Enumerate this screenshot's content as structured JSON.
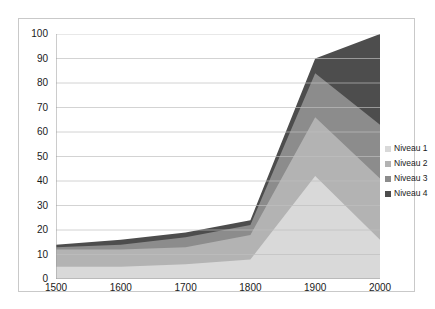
{
  "chart_data": {
    "type": "area",
    "title": "",
    "xlabel": "",
    "ylabel": "",
    "stacked": true,
    "grid": true,
    "legend_position": "right",
    "x": [
      1500,
      1600,
      1700,
      1800,
      1900,
      2000
    ],
    "xlim": [
      1500,
      2000
    ],
    "ylim": [
      0,
      100
    ],
    "ytick_labels": [
      "0",
      "10",
      "20",
      "30",
      "40",
      "50",
      "60",
      "70",
      "80",
      "90",
      "100"
    ],
    "yticks": [
      0,
      10,
      20,
      30,
      40,
      50,
      60,
      70,
      80,
      90,
      100
    ],
    "xtick_labels": [
      "1500",
      "1600",
      "1700",
      "1800",
      "1900",
      "2000"
    ],
    "xticks": [
      1500,
      1600,
      1700,
      1800,
      1900,
      2000
    ],
    "series": [
      {
        "name": "Niveau 1",
        "color": "#d9d9d9",
        "values": [
          5,
          5,
          6,
          8,
          42,
          16
        ]
      },
      {
        "name": "Niveau 2",
        "color": "#b3b3b3",
        "values": [
          7,
          7,
          7,
          10,
          24,
          25
        ]
      },
      {
        "name": "Niveau 3",
        "color": "#8c8c8c",
        "values": [
          1,
          2,
          4,
          4,
          18,
          22
        ]
      },
      {
        "name": "Niveau 4",
        "color": "#4d4d4d",
        "values": [
          1,
          2,
          2,
          2,
          6,
          37
        ]
      }
    ],
    "cumulative_totals": [
      14,
      16,
      19,
      24,
      90,
      100
    ],
    "colors": {
      "grid": "#bfbfbf",
      "axis": "#9a9a9a",
      "frame": "#c9c9c9",
      "text": "#1a1a1a",
      "background": "#ffffff"
    }
  },
  "legend": {
    "items": [
      {
        "label": "Niveau 1"
      },
      {
        "label": "Niveau 2"
      },
      {
        "label": "Niveau 3"
      },
      {
        "label": "Niveau 4"
      }
    ]
  }
}
